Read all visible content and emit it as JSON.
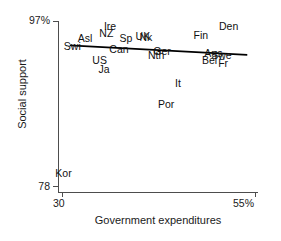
{
  "chart_data": {
    "type": "scatter",
    "title": "",
    "xlabel": "Government expenditures",
    "ylabel": "Social support",
    "xlim": [
      30,
      55
    ],
    "ylim": [
      78,
      97
    ],
    "xticks": [
      "30",
      "55%"
    ],
    "yticks": [
      "97%",
      "78"
    ],
    "grid": false,
    "legend": "none",
    "note": "Country abbreviations plotted as text markers; a fitted regression line slopes gently downward from left to right.",
    "points": [
      {
        "label": "Swi",
        "x": 31.4,
        "y": 94.0
      },
      {
        "label": "Asl",
        "x": 33.2,
        "y": 94.9
      },
      {
        "label": "Ire",
        "x": 36.6,
        "y": 96.3
      },
      {
        "label": "NZ",
        "x": 36.0,
        "y": 95.5
      },
      {
        "label": "Can",
        "x": 37.3,
        "y": 93.7
      },
      {
        "label": "Sp",
        "x": 38.6,
        "y": 94.9
      },
      {
        "label": "US",
        "x": 35.1,
        "y": 92.4
      },
      {
        "label": "Ja",
        "x": 35.9,
        "y": 91.4
      },
      {
        "label": "UK",
        "x": 40.7,
        "y": 95.2
      },
      {
        "label": "Nk",
        "x": 41.2,
        "y": 95.1
      },
      {
        "label": "Ger",
        "x": 43.0,
        "y": 93.4
      },
      {
        "label": "Nth",
        "x": 42.3,
        "y": 93.0
      },
      {
        "label": "It",
        "x": 45.8,
        "y": 89.8
      },
      {
        "label": "Por",
        "x": 43.6,
        "y": 87.3
      },
      {
        "label": "Fin",
        "x": 48.2,
        "y": 95.3
      },
      {
        "label": "Den",
        "x": 51.5,
        "y": 96.3
      },
      {
        "label": "Aus",
        "x": 49.6,
        "y": 93.2
      },
      {
        "label": "Swe",
        "x": 50.5,
        "y": 93.0
      },
      {
        "label": "Bel",
        "x": 49.3,
        "y": 92.4
      },
      {
        "label": "Fr",
        "x": 51.4,
        "y": 92.0
      },
      {
        "label": "Kor",
        "x": 30.3,
        "y": 79.4
      }
    ],
    "fit_line": {
      "x0": 31.0,
      "y0": 94.2,
      "x1": 54.0,
      "y1": 93.1
    }
  },
  "axes": {
    "y_top_label": "97%",
    "y_bottom_label": "78",
    "x_left_label": "30",
    "x_right_label": "55%",
    "y_title": "Social support",
    "x_title": "Government expenditures"
  },
  "labels": {
    "p0": "Swi",
    "p1": "Asl",
    "p2": "Ire",
    "p3": "NZ",
    "p4": "Can",
    "p5": "Sp",
    "p6": "US",
    "p7": "Ja",
    "p8": "UK",
    "p9": "Nk",
    "p10": "Ger",
    "p11": "Nth",
    "p12": "It",
    "p13": "Por",
    "p14": "Fin",
    "p15": "Den",
    "p16": "Aus",
    "p17": "Swe",
    "p18": "Bel",
    "p19": "Fr",
    "p20": "Kor"
  },
  "colors": {
    "axis": "#4d4d4d",
    "text": "#1a1a1a",
    "line": "#000000",
    "background": "#ffffff"
  }
}
